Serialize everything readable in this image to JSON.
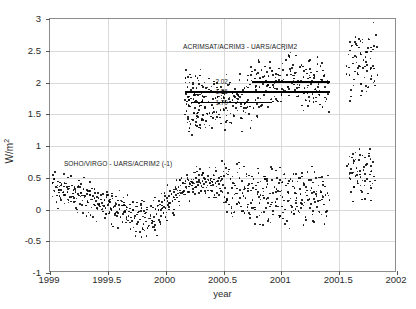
{
  "figure": {
    "background_color": "#ffffff",
    "axis_color": "#8c8c8c",
    "grid_color": "#d9d9d9",
    "marker_color": "#000000"
  },
  "axes": {
    "xlabel": "year",
    "ylabel_text": "W/m",
    "ylabel_exponent": "2",
    "x_ticks": [
      "1999",
      "1999.5",
      "2000",
      "2000.5",
      "2001",
      "2001.5",
      "2002"
    ],
    "x_tick_values": [
      1999,
      1999.5,
      2000,
      2000.5,
      2001,
      2001.5,
      2002
    ],
    "y_ticks": [
      "-1",
      "-0.5",
      "0",
      "0.5",
      "1",
      "1.5",
      "2",
      "2.5",
      "3"
    ],
    "y_tick_values": [
      -1,
      -0.5,
      0,
      0.5,
      1,
      1.5,
      2,
      2.5,
      3
    ]
  },
  "annotations": {
    "upper_series_label": "ACRIMSAT/ACRIM3 - UARS/ACRIM2",
    "lower_series_label": "SOHO/VIRGO - UARS/ACRIM2 (-1)",
    "mean_labels": [
      "2.02",
      "1.86",
      "1.70"
    ]
  },
  "chart_data": {
    "type": "scatter",
    "title": "",
    "xlabel": "year",
    "ylabel": "W/m^2",
    "xlim": [
      1999,
      2002
    ],
    "ylim": [
      -1,
      3
    ],
    "grid": true,
    "legend": "none (in-plot text annotations)",
    "annotations": [
      {
        "text": "ACRIMSAT/ACRIM3 - UARS/ACRIM2",
        "x": 2000.15,
        "y": 2.62
      },
      {
        "text": "SOHO/VIRGO - UARS/ACRIM2 (-1)",
        "x": 1999.12,
        "y": 0.78
      },
      {
        "text": "2.02",
        "x": 2000.43,
        "y": 2.02
      },
      {
        "text": "1.86",
        "x": 2000.43,
        "y": 1.86
      },
      {
        "text": "1.70",
        "x": 2000.43,
        "y": 1.7
      }
    ],
    "reference_lines": [
      {
        "label": "2.02",
        "y": 2.02,
        "x_start": 2000.75,
        "x_end": 2001.42,
        "orientation": "horizontal"
      },
      {
        "label": "1.86",
        "y": 1.86,
        "x_start": 2000.17,
        "x_end": 2001.42,
        "orientation": "horizontal"
      },
      {
        "label": "1.70",
        "y": 1.7,
        "x_start": 2000.22,
        "x_end": 2000.92,
        "orientation": "horizontal"
      }
    ],
    "series": [
      {
        "name": "ACRIMSAT/ACRIM3 - UARS/ACRIM2",
        "marker": "dot",
        "x": [
          2000.17,
          2000.175,
          2000.18,
          2000.185,
          2000.19,
          2000.195,
          2000.2,
          2000.205,
          2000.21,
          2000.215,
          2000.22,
          2000.225,
          2000.23,
          2000.235,
          2000.24,
          2000.245,
          2000.25,
          2000.255,
          2000.26,
          2000.265,
          2000.27,
          2000.275,
          2000.28,
          2000.285,
          2000.29,
          2000.295,
          2000.3,
          2000.305,
          2000.31,
          2000.315,
          2000.32,
          2000.325,
          2000.33,
          2000.34,
          2000.35,
          2000.36,
          2000.37,
          2000.38,
          2000.39,
          2000.4,
          2000.41,
          2000.42,
          2000.43,
          2000.44,
          2000.45,
          2000.46,
          2000.47,
          2000.48,
          2000.49,
          2000.5,
          2000.51,
          2000.52,
          2000.53,
          2000.54,
          2000.55,
          2000.56,
          2000.57,
          2000.58,
          2000.59,
          2000.6,
          2000.61,
          2000.62,
          2000.63,
          2000.64,
          2000.65,
          2000.66,
          2000.67,
          2000.68,
          2000.69,
          2000.7,
          2000.71,
          2000.72,
          2000.73,
          2000.74,
          2000.75,
          2000.76,
          2000.77,
          2000.78,
          2000.79,
          2000.8,
          2000.81,
          2000.82,
          2000.83,
          2000.84,
          2000.85,
          2000.86,
          2000.87,
          2000.88,
          2000.89,
          2000.9,
          2000.91,
          2000.92,
          2000.93,
          2000.94,
          2000.95,
          2000.96,
          2000.97,
          2000.98,
          2000.99,
          2001.0,
          2001.01,
          2001.02,
          2001.03,
          2001.04,
          2001.05,
          2001.06,
          2001.07,
          2001.08,
          2001.09,
          2001.1,
          2001.11,
          2001.12,
          2001.13,
          2001.14,
          2001.15,
          2001.16,
          2001.17,
          2001.18,
          2001.19,
          2001.2,
          2001.21,
          2001.22,
          2001.23,
          2001.24,
          2001.25,
          2001.26,
          2001.27,
          2001.28,
          2001.29,
          2001.3,
          2001.31,
          2001.32,
          2001.33,
          2001.34,
          2001.35,
          2001.36,
          2001.37,
          2001.38,
          2001.39,
          2001.4,
          2001.58,
          2001.59,
          2001.6,
          2001.61,
          2001.62,
          2001.63,
          2001.64,
          2001.65,
          2001.66,
          2001.67,
          2001.68,
          2001.69,
          2001.7,
          2001.71,
          2001.72,
          2001.73,
          2001.74,
          2001.75,
          2001.76,
          2001.77,
          2001.78,
          2001.79,
          2001.8,
          2001.81,
          2001.82
        ],
        "y": [
          2.07,
          1.82,
          1.55,
          1.7,
          1.93,
          1.46,
          1.78,
          2.0,
          1.62,
          1.35,
          1.88,
          1.67,
          1.42,
          1.97,
          1.74,
          1.51,
          1.83,
          1.6,
          1.38,
          1.91,
          1.69,
          1.47,
          1.8,
          2.03,
          1.57,
          1.33,
          1.86,
          1.64,
          1.41,
          1.95,
          1.72,
          1.49,
          1.84,
          1.61,
          1.39,
          1.92,
          1.7,
          1.52,
          1.87,
          1.65,
          1.44,
          1.98,
          1.76,
          1.54,
          1.89,
          1.67,
          1.45,
          1.93,
          1.71,
          1.58,
          1.82,
          1.6,
          1.4,
          1.96,
          1.74,
          1.51,
          1.85,
          1.63,
          1.47,
          1.9,
          1.68,
          1.56,
          1.79,
          2.05,
          1.62,
          1.43,
          1.88,
          1.66,
          1.53,
          1.94,
          1.72,
          1.5,
          1.97,
          2.12,
          1.84,
          1.6,
          2.06,
          1.88,
          1.66,
          2.15,
          1.93,
          1.75,
          2.2,
          1.98,
          1.8,
          2.25,
          2.03,
          1.85,
          2.1,
          1.92,
          1.73,
          2.18,
          1.96,
          1.78,
          2.08,
          1.9,
          1.7,
          2.22,
          2.0,
          1.82,
          2.3,
          2.05,
          1.87,
          2.35,
          2.12,
          1.94,
          2.4,
          2.18,
          1.99,
          2.28,
          2.06,
          1.88,
          2.16,
          1.97,
          1.79,
          2.24,
          2.02,
          1.84,
          2.09,
          1.91,
          1.72,
          2.14,
          1.95,
          1.77,
          2.21,
          2.0,
          1.82,
          2.07,
          1.89,
          1.7,
          2.17,
          1.98,
          1.8,
          2.26,
          2.04,
          1.86,
          2.11,
          1.93,
          1.74,
          2.02,
          2.44,
          2.12,
          1.88,
          2.58,
          2.3,
          2.05,
          2.72,
          2.4,
          2.15,
          2.55,
          2.25,
          1.98,
          2.63,
          2.35,
          2.08,
          2.48,
          2.18,
          1.92,
          2.68,
          2.38,
          2.1,
          2.52,
          2.22,
          1.95,
          2.75
        ]
      },
      {
        "name": "SOHO/VIRGO - UARS/ACRIM2 (-1)",
        "marker": "dot",
        "x": [
          1999.02,
          1999.03,
          1999.04,
          1999.05,
          1999.06,
          1999.07,
          1999.08,
          1999.09,
          1999.1,
          1999.11,
          1999.12,
          1999.13,
          1999.14,
          1999.15,
          1999.16,
          1999.17,
          1999.18,
          1999.19,
          1999.2,
          1999.21,
          1999.22,
          1999.23,
          1999.24,
          1999.25,
          1999.26,
          1999.27,
          1999.28,
          1999.29,
          1999.3,
          1999.31,
          1999.32,
          1999.33,
          1999.34,
          1999.35,
          1999.36,
          1999.37,
          1999.38,
          1999.39,
          1999.4,
          1999.41,
          1999.42,
          1999.43,
          1999.44,
          1999.45,
          1999.46,
          1999.47,
          1999.48,
          1999.49,
          1999.5,
          1999.51,
          1999.52,
          1999.53,
          1999.54,
          1999.55,
          1999.56,
          1999.57,
          1999.58,
          1999.59,
          1999.6,
          1999.61,
          1999.62,
          1999.63,
          1999.64,
          1999.65,
          1999.66,
          1999.67,
          1999.68,
          1999.69,
          1999.7,
          1999.71,
          1999.72,
          1999.73,
          1999.74,
          1999.75,
          1999.76,
          1999.77,
          1999.78,
          1999.79,
          1999.8,
          1999.81,
          1999.82,
          1999.83,
          1999.84,
          1999.85,
          1999.86,
          1999.87,
          1999.88,
          1999.89,
          1999.9,
          1999.91,
          1999.92,
          1999.93,
          1999.94,
          1999.95,
          1999.96,
          1999.97,
          1999.98,
          1999.99,
          2000.0,
          2000.01,
          2000.02,
          2000.03,
          2000.04,
          2000.05,
          2000.06,
          2000.07,
          2000.08,
          2000.09,
          2000.1,
          2000.11,
          2000.12,
          2000.13,
          2000.14,
          2000.15,
          2000.16,
          2000.17,
          2000.18,
          2000.19,
          2000.2,
          2000.21,
          2000.22,
          2000.23,
          2000.24,
          2000.25,
          2000.26,
          2000.27,
          2000.28,
          2000.29,
          2000.3,
          2000.31,
          2000.32,
          2000.33,
          2000.34,
          2000.35,
          2000.36,
          2000.37,
          2000.38,
          2000.39,
          2000.4,
          2000.41,
          2000.42,
          2000.43,
          2000.44,
          2000.45,
          2000.46,
          2000.47,
          2000.48,
          2000.49,
          2000.5,
          2000.51,
          2000.52,
          2000.53,
          2000.54,
          2000.55,
          2000.56,
          2000.57,
          2000.58,
          2000.59,
          2000.6,
          2000.61,
          2000.62,
          2000.63,
          2000.64,
          2000.65,
          2000.66,
          2000.67,
          2000.68,
          2000.69,
          2000.7,
          2000.71,
          2000.72,
          2000.73,
          2000.74,
          2000.75,
          2000.76,
          2000.77,
          2000.78,
          2000.79,
          2000.8,
          2000.81,
          2000.82,
          2000.83,
          2000.84,
          2000.85,
          2000.86,
          2000.87,
          2000.88,
          2000.89,
          2000.9,
          2000.91,
          2000.92,
          2000.93,
          2000.94,
          2000.95,
          2000.96,
          2000.97,
          2000.98,
          2000.99,
          2001.0,
          2001.01,
          2001.02,
          2001.03,
          2001.04,
          2001.05,
          2001.06,
          2001.07,
          2001.08,
          2001.09,
          2001.1,
          2001.11,
          2001.12,
          2001.13,
          2001.14,
          2001.15,
          2001.16,
          2001.17,
          2001.18,
          2001.19,
          2001.2,
          2001.21,
          2001.22,
          2001.23,
          2001.24,
          2001.25,
          2001.26,
          2001.27,
          2001.28,
          2001.29,
          2001.3,
          2001.31,
          2001.32,
          2001.33,
          2001.34,
          2001.35,
          2001.36,
          2001.37,
          2001.38,
          2001.39,
          2001.4,
          2001.58,
          2001.59,
          2001.6,
          2001.61,
          2001.62,
          2001.63,
          2001.64,
          2001.65,
          2001.66,
          2001.67,
          2001.68,
          2001.69,
          2001.7,
          2001.71,
          2001.72,
          2001.73,
          2001.74,
          2001.75,
          2001.76,
          2001.77,
          2001.78,
          2001.79,
          2001.8
        ],
        "y": [
          0.42,
          0.3,
          0.48,
          0.35,
          0.22,
          0.44,
          0.31,
          0.18,
          0.4,
          0.27,
          0.36,
          0.23,
          0.41,
          0.28,
          0.15,
          0.33,
          0.2,
          0.38,
          0.25,
          0.12,
          0.3,
          0.17,
          0.35,
          0.22,
          0.09,
          0.27,
          0.14,
          0.32,
          0.19,
          0.06,
          0.24,
          0.11,
          0.29,
          0.16,
          0.03,
          0.21,
          0.08,
          0.26,
          0.13,
          0.0,
          0.18,
          0.05,
          0.23,
          0.1,
          -0.03,
          0.15,
          0.02,
          0.2,
          0.07,
          -0.06,
          0.12,
          -0.01,
          0.17,
          0.04,
          -0.09,
          0.09,
          -0.04,
          0.14,
          0.01,
          -0.12,
          0.06,
          -0.07,
          0.11,
          -0.02,
          -0.15,
          0.03,
          -0.1,
          0.08,
          -0.05,
          -0.18,
          0.0,
          -0.13,
          0.05,
          -0.08,
          -0.2,
          -0.03,
          -0.16,
          0.02,
          -0.11,
          -0.23,
          -0.06,
          -0.19,
          0.0,
          -0.14,
          -0.25,
          -0.09,
          -0.21,
          0.03,
          -0.12,
          -0.24,
          -0.07,
          0.05,
          -0.17,
          0.08,
          -0.1,
          0.12,
          -0.05,
          0.15,
          0.02,
          0.18,
          0.07,
          0.21,
          0.1,
          0.25,
          0.13,
          0.28,
          0.16,
          0.32,
          0.19,
          0.35,
          0.22,
          0.38,
          0.26,
          0.42,
          0.29,
          0.45,
          0.33,
          0.48,
          0.36,
          0.4,
          0.44,
          0.38,
          0.47,
          0.41,
          0.35,
          0.43,
          0.39,
          0.46,
          0.42,
          0.37,
          0.45,
          0.4,
          0.48,
          0.43,
          0.38,
          0.46,
          0.41,
          0.49,
          0.44,
          0.39,
          0.47,
          0.42,
          0.36,
          0.45,
          0.4,
          0.33,
          0.52,
          0.28,
          0.6,
          0.2,
          0.65,
          0.15,
          0.55,
          0.08,
          0.48,
          0.02,
          0.42,
          -0.05,
          0.38,
          0.25,
          0.58,
          0.12,
          0.5,
          0.05,
          0.45,
          -0.02,
          0.35,
          0.18,
          0.52,
          0.08,
          0.4,
          -0.08,
          0.3,
          0.15,
          0.48,
          0.0,
          0.38,
          -0.12,
          0.28,
          0.1,
          0.44,
          -0.05,
          0.33,
          0.18,
          0.52,
          0.02,
          0.4,
          -0.15,
          0.25,
          0.08,
          0.46,
          -0.02,
          0.35,
          0.12,
          0.5,
          0.05,
          0.42,
          -0.1,
          0.3,
          0.2,
          0.55,
          0.0,
          0.38,
          -0.18,
          0.28,
          0.14,
          0.48,
          0.04,
          0.36,
          -0.06,
          0.26,
          0.18,
          0.44,
          -0.02,
          0.32,
          0.1,
          0.52,
          0.06,
          0.4,
          -0.12,
          0.22,
          0.15,
          0.46,
          0.02,
          0.34,
          -0.08,
          0.28,
          0.12,
          0.5,
          0.04,
          0.38,
          -0.04,
          0.3,
          0.16,
          0.44,
          0.08,
          0.36,
          -0.1,
          0.26,
          0.72,
          0.5,
          0.28,
          0.82,
          0.58,
          0.35,
          0.9,
          0.65,
          0.42,
          0.78,
          0.55,
          0.3,
          0.85,
          0.62,
          0.38,
          0.7,
          0.48,
          0.25,
          0.88,
          0.6,
          0.33,
          0.75,
          0.52
        ]
      }
    ]
  }
}
